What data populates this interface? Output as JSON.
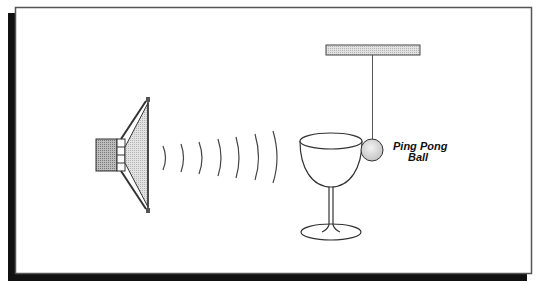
{
  "diagram": {
    "labels": {
      "ball_line1": "Ping Pong",
      "ball_line2": "Ball"
    },
    "elements": {
      "speaker": "loudspeaker-icon",
      "sound_waves": "sound-wave-arcs",
      "glass": "wine-glass",
      "ball": "ping-pong-ball",
      "string": "suspension-string",
      "support": "support-bar"
    },
    "wave_count": 7,
    "colors": {
      "frame_border": "#555555",
      "shadow": "#111111",
      "line": "#333333",
      "fill_gray": "#cfcfcf",
      "fill_light": "#e6e6e6",
      "background": "#ffffff"
    }
  }
}
